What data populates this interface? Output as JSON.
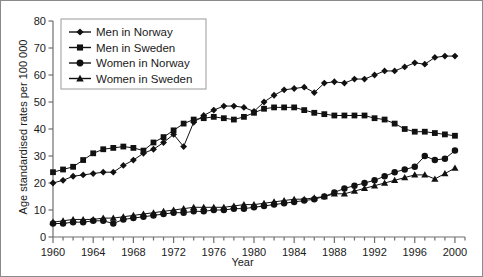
{
  "chart_data": {
    "type": "line",
    "title": "",
    "xlabel": "Year",
    "ylabel": "Age standardised rates per 100 000",
    "xlim": [
      1960,
      2001
    ],
    "ylim": [
      0,
      80
    ],
    "ytick_step": 10,
    "xtick_major_step": 4,
    "xtick_minor_step": 1,
    "grid": false,
    "legend_position": "top-left",
    "xticks": [
      "1960",
      "1964",
      "1968",
      "1972",
      "1976",
      "1980",
      "1984",
      "1988",
      "1992",
      "1996",
      "2000"
    ],
    "yticks": [
      "0",
      "10",
      "20",
      "30",
      "40",
      "50",
      "60",
      "70",
      "80"
    ],
    "x": [
      1960,
      1961,
      1962,
      1963,
      1964,
      1965,
      1966,
      1967,
      1968,
      1969,
      1970,
      1971,
      1972,
      1973,
      1974,
      1975,
      1976,
      1977,
      1978,
      1979,
      1980,
      1981,
      1982,
      1983,
      1984,
      1985,
      1986,
      1987,
      1988,
      1989,
      1990,
      1991,
      1992,
      1993,
      1994,
      1995,
      1996,
      1997,
      1998,
      1999,
      2000
    ],
    "series": [
      {
        "name": "Men in Norway",
        "marker": "diamond",
        "color": "#111111",
        "values": [
          20,
          21,
          22.5,
          23,
          23.5,
          24,
          24,
          26.5,
          28.5,
          31,
          32.5,
          35,
          38,
          33.5,
          42.5,
          45,
          47,
          48.5,
          48.5,
          48,
          46.5,
          50,
          52.5,
          54.5,
          55,
          55.5,
          53.5,
          57,
          57.5,
          57,
          58.5,
          58.5,
          60,
          61.5,
          61.5,
          63,
          64.5,
          64,
          66.5,
          67,
          67
        ]
      },
      {
        "name": "Men in Sweden",
        "marker": "square",
        "color": "#111111",
        "values": [
          24,
          25,
          26,
          28.5,
          31,
          32.5,
          33,
          33.5,
          33,
          32,
          35,
          37,
          39.5,
          42,
          43.5,
          44,
          44.5,
          44,
          43.5,
          44.5,
          46,
          47.5,
          48,
          48,
          48,
          47,
          46,
          45.5,
          45,
          45,
          45,
          45,
          44,
          43.5,
          42,
          40,
          39,
          39,
          38.5,
          38,
          37.5
        ]
      },
      {
        "name": "Women in Norway",
        "marker": "circle",
        "color": "#111111",
        "values": [
          5,
          5,
          5.5,
          5.5,
          6,
          6,
          5,
          6.5,
          7,
          7.5,
          8,
          8.5,
          9,
          9,
          9.5,
          9.5,
          10,
          10,
          10.5,
          10.5,
          11,
          11.5,
          12,
          12.5,
          13,
          13.5,
          14,
          15,
          16.5,
          18,
          19,
          20,
          21,
          22.5,
          24,
          25,
          26,
          30,
          28.5,
          29,
          32
        ]
      },
      {
        "name": "Women in Sweden",
        "marker": "triangle",
        "color": "#111111",
        "values": [
          5.5,
          6,
          6.5,
          6.5,
          6.5,
          7,
          7,
          7.5,
          8,
          8.5,
          9,
          9.5,
          10,
          10.5,
          11,
          11,
          11,
          11,
          11.5,
          12,
          12,
          12.5,
          13,
          13.5,
          14,
          14,
          14.5,
          15,
          16,
          16,
          17,
          18,
          19,
          20,
          21,
          22,
          23,
          23,
          21.5,
          23.5,
          25.5
        ]
      }
    ]
  },
  "legend": {
    "items": [
      {
        "label": "Men in Norway"
      },
      {
        "label": "Men in Sweden"
      },
      {
        "label": "Women in Norway"
      },
      {
        "label": "Women in Sweden"
      }
    ]
  }
}
